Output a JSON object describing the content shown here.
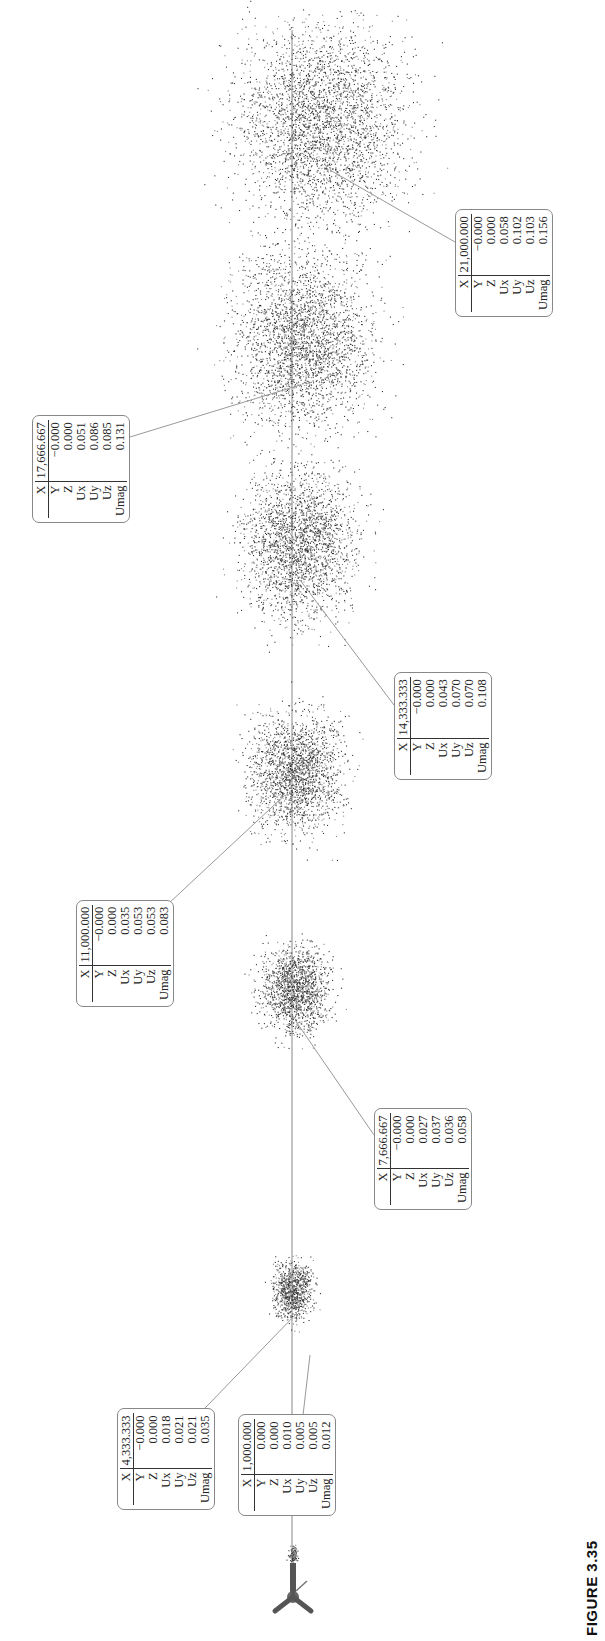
{
  "figure": {
    "caption": "FIGURE 3.35",
    "orientation": "rotated-90-ccw"
  },
  "probes": [
    {
      "X": "1,000.000",
      "Y": "0.000",
      "Z": "0.000",
      "Ux": "0.010",
      "Uy": "0.005",
      "Uz": "0.005",
      "Umag": "0.012",
      "box": [
        238,
        1516
      ],
      "anchor": [
        310,
        1355
      ]
    },
    {
      "X": "4,333.333",
      "Y": "−0.000",
      "Z": "0.000",
      "Ux": "0.018",
      "Uy": "0.021",
      "Uz": "0.021",
      "Umag": "0.035",
      "box": [
        117,
        1510
      ],
      "anchor": [
        297,
        1313
      ]
    },
    {
      "X": "7,666.667",
      "Y": "−0.000",
      "Z": "0.000",
      "Ux": "0.027",
      "Uy": "0.037",
      "Uz": "0.036",
      "Umag": "0.058",
      "box": [
        374,
        1210
      ],
      "anchor": [
        295,
        1020
      ]
    },
    {
      "X": "11,000.000",
      "Y": "−0.000",
      "Z": "0.000",
      "Ux": "0.035",
      "Uy": "0.053",
      "Uz": "0.053",
      "Umag": "0.083",
      "box": [
        76,
        1007
      ],
      "anchor": [
        285,
        795
      ]
    },
    {
      "X": "14,333.333",
      "Y": "−0.000",
      "Z": "0.000",
      "Ux": "0.043",
      "Uy": "0.070",
      "Uz": "0.070",
      "Umag": "0.108",
      "box": [
        394,
        780
      ],
      "anchor": [
        300,
        580
      ]
    },
    {
      "X": "17,666.667",
      "Y": "−0.000",
      "Z": "0.000",
      "Ux": "0.051",
      "Uy": "0.086",
      "Uz": "0.085",
      "Umag": "0.131",
      "box": [
        32,
        523
      ],
      "anchor": [
        300,
        385
      ]
    },
    {
      "X": "21,000.000",
      "Y": "−0.000",
      "Z": "0.000",
      "Ux": "0.058",
      "Uy": "0.102",
      "Uz": "0.103",
      "Umag": "0.156",
      "box": [
        455,
        317
      ],
      "anchor": [
        330,
        170
      ]
    }
  ],
  "row_labels": [
    "X",
    "Y",
    "Z",
    "Ux",
    "Uy",
    "Uz",
    "Umag"
  ],
  "clouds": [
    {
      "cx": 293,
      "cy": 1555,
      "rx": 6,
      "ry": 13,
      "n": 120
    },
    {
      "cx": 293,
      "cy": 1290,
      "rx": 28,
      "ry": 40,
      "n": 900
    },
    {
      "cx": 295,
      "cy": 990,
      "rx": 48,
      "ry": 62,
      "n": 1500
    },
    {
      "cx": 295,
      "cy": 775,
      "rx": 65,
      "ry": 85,
      "n": 2000
    },
    {
      "cx": 300,
      "cy": 545,
      "rx": 80,
      "ry": 105,
      "n": 2400
    },
    {
      "cx": 305,
      "cy": 340,
      "rx": 98,
      "ry": 125,
      "n": 2800
    },
    {
      "cx": 322,
      "cy": 125,
      "rx": 118,
      "ry": 140,
      "n": 3200
    }
  ],
  "centerline": {
    "x": 292,
    "y_top": 30,
    "y_bottom": 1595
  }
}
